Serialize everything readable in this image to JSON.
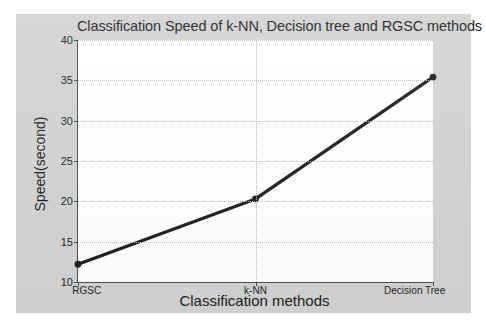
{
  "chart_data": {
    "type": "line",
    "title": "Classification Speed of k-NN, Decision tree and RGSC methods",
    "xlabel": "Classification methods",
    "ylabel": "Speed(second)",
    "categories": [
      "RGSC",
      "k-NN",
      "Decision Tree"
    ],
    "values": [
      12.2,
      20.3,
      35.4
    ],
    "series": [
      {
        "name": "Speed(second)",
        "values": [
          12.2,
          20.3,
          35.4
        ]
      }
    ],
    "ylim": [
      10,
      40
    ],
    "yticks": [
      10,
      15,
      20,
      25,
      30,
      35,
      40
    ],
    "ytick_labels": [
      "10",
      "15",
      "20",
      "25",
      "30",
      "35",
      "40"
    ],
    "xtick_labels": [
      "RGSC",
      "k-NN",
      "Decision Tree"
    ],
    "grid": "dotted horizontal gridlines at each y-tick and a dotted vertical gridline at k-NN",
    "legend": "none",
    "line_color": "#1c1c1c",
    "marker": "circle",
    "figure_background": "#d2d2d2",
    "plot_background": "#ffffff"
  }
}
